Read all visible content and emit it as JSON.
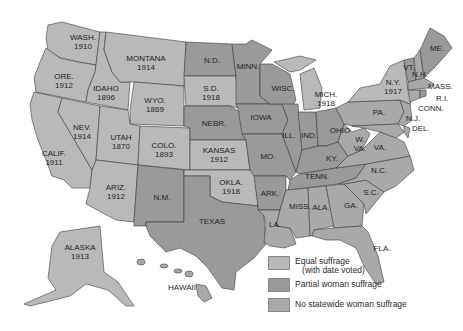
{
  "map": {
    "title": "Woman suffrage before the 19th Amendment",
    "states": [
      {
        "id": "wa",
        "label": "WASH.",
        "year": "1910",
        "category": "equal"
      },
      {
        "id": "or",
        "label": "ORE.",
        "year": "1912",
        "category": "equal"
      },
      {
        "id": "ca",
        "label": "CALIF.",
        "year": "1911",
        "category": "equal"
      },
      {
        "id": "id",
        "label": "IDAHO",
        "year": "1896",
        "category": "equal"
      },
      {
        "id": "nv",
        "label": "NEV.",
        "year": "1914",
        "category": "equal"
      },
      {
        "id": "mt",
        "label": "MONTANA",
        "year": "1914",
        "category": "equal"
      },
      {
        "id": "wy",
        "label": "WYO.",
        "year": "1869",
        "category": "equal"
      },
      {
        "id": "ut",
        "label": "UTAH",
        "year": "1870",
        "category": "equal"
      },
      {
        "id": "az",
        "label": "ARIZ.",
        "year": "1912",
        "category": "equal"
      },
      {
        "id": "co",
        "label": "COLO.",
        "year": "1893",
        "category": "equal"
      },
      {
        "id": "nm",
        "label": "N.M.",
        "year": "",
        "category": "partial"
      },
      {
        "id": "nd",
        "label": "N.D.",
        "year": "",
        "category": "partial"
      },
      {
        "id": "sd",
        "label": "S.D.",
        "year": "1918",
        "category": "equal"
      },
      {
        "id": "ne",
        "label": "NEBR.",
        "year": "",
        "category": "partial"
      },
      {
        "id": "ks",
        "label": "KANSAS",
        "year": "1912",
        "category": "equal"
      },
      {
        "id": "ok",
        "label": "OKLA.",
        "year": "1918",
        "category": "equal"
      },
      {
        "id": "tx",
        "label": "TEXAS",
        "year": "",
        "category": "partial"
      },
      {
        "id": "mn",
        "label": "MINN.",
        "year": "",
        "category": "partial"
      },
      {
        "id": "ia",
        "label": "IOWA",
        "year": "",
        "category": "partial"
      },
      {
        "id": "mo",
        "label": "MO.",
        "year": "",
        "category": "partial"
      },
      {
        "id": "ar",
        "label": "ARK.",
        "year": "",
        "category": "partial"
      },
      {
        "id": "la",
        "label": "LA.",
        "year": "",
        "category": "none"
      },
      {
        "id": "wi",
        "label": "WISC.",
        "year": "",
        "category": "partial"
      },
      {
        "id": "il",
        "label": "ILL.",
        "year": "",
        "category": "partial"
      },
      {
        "id": "mi",
        "label": "MICH.",
        "year": "1918",
        "category": "equal"
      },
      {
        "id": "in",
        "label": "IND.",
        "year": "",
        "category": "partial"
      },
      {
        "id": "oh",
        "label": "OHIO",
        "year": "",
        "category": "partial"
      },
      {
        "id": "ky",
        "label": "KY.",
        "year": "",
        "category": "partial"
      },
      {
        "id": "tn",
        "label": "TENN.",
        "year": "",
        "category": "partial"
      },
      {
        "id": "ms",
        "label": "MISS.",
        "year": "",
        "category": "none"
      },
      {
        "id": "al",
        "label": "ALA.",
        "year": "",
        "category": "none"
      },
      {
        "id": "ga",
        "label": "GA.",
        "year": "",
        "category": "none"
      },
      {
        "id": "fl",
        "label": "FLA.",
        "year": "",
        "category": "none"
      },
      {
        "id": "sc",
        "label": "S.C.",
        "year": "",
        "category": "none"
      },
      {
        "id": "nc",
        "label": "N.C.",
        "year": "",
        "category": "none"
      },
      {
        "id": "va",
        "label": "VA.",
        "year": "",
        "category": "none"
      },
      {
        "id": "wv",
        "label": "W.\nVA.",
        "year": "",
        "category": "none"
      },
      {
        "id": "pa",
        "label": "PA.",
        "year": "",
        "category": "none"
      },
      {
        "id": "ny",
        "label": "N.Y.",
        "year": "1917",
        "category": "equal"
      },
      {
        "id": "vt",
        "label": "VT.",
        "year": "",
        "category": "partial"
      },
      {
        "id": "nh",
        "label": "N.H.",
        "year": "",
        "category": "none"
      },
      {
        "id": "me",
        "label": "ME.",
        "year": "",
        "category": "partial"
      },
      {
        "id": "ma",
        "label": "MASS.",
        "year": "",
        "category": "none"
      },
      {
        "id": "ri",
        "label": "R.I.",
        "year": "",
        "category": "partial"
      },
      {
        "id": "ct",
        "label": "CONN.",
        "year": "",
        "category": "none"
      },
      {
        "id": "nj",
        "label": "N.J.",
        "year": "",
        "category": "none"
      },
      {
        "id": "de",
        "label": "DEL.",
        "year": "",
        "category": "none"
      },
      {
        "id": "md",
        "label": "MD.",
        "year": "",
        "category": "none"
      },
      {
        "id": "ak",
        "label": "ALASKA",
        "year": "1913",
        "category": "equal"
      },
      {
        "id": "hi",
        "label": "HAWAII",
        "year": "",
        "category": "none"
      }
    ],
    "labels": {
      "wa": "WASH.\n1910",
      "or": "ORE.\n1912",
      "ca": "CALIF.\n1911",
      "id": "IDAHO\n1896",
      "nv": "NEV.\n1914",
      "mt": "MONTANA\n1914",
      "wy": "WYO.\n1869",
      "ut": "UTAH\n1870",
      "az": "ARIZ.\n1912",
      "co": "COLO.\n1893",
      "nm": "N.M.",
      "nd": "N.D.",
      "sd": "S.D.\n1918",
      "ne": "NEBR.",
      "ks": "KANSAS\n1912",
      "ok": "OKLA.\n1918",
      "tx": "TEXAS",
      "mn": "MINN.",
      "ia": "IOWA",
      "mo": "MO.",
      "ar": "ARK.",
      "la": "LA.",
      "wi": "WISC.",
      "il": "ILL.",
      "mi": "MICH.\n1918",
      "in": "IND.",
      "oh": "OHIO",
      "ky": "KY.",
      "tn": "TENN.",
      "ms": "MISS.",
      "al": "ALA.",
      "ga": "GA.",
      "fl": "FLA.",
      "sc": "S.C.",
      "nc": "N.C.",
      "va": "VA.",
      "wv": "W.\nVA.",
      "pa": "PA.",
      "ny": "N.Y.\n1917",
      "vt": "VT.",
      "nh": "N.H.",
      "me": "ME.",
      "ma": "MASS.",
      "ri": "R.I.",
      "ct": "CONN.",
      "nj": "N.J.",
      "de": "DEL.",
      "md": "MD.",
      "ak": "ALASKA\n1913",
      "hi": "HAWAII"
    }
  },
  "legend": {
    "items": [
      {
        "category": "equal",
        "label": "Equal suffrage\n   (with date voted)",
        "color": "#b9b9b9"
      },
      {
        "category": "partial",
        "label": "Partial woman suffrage",
        "color": "#9a9a9a"
      },
      {
        "category": "none",
        "label": "No statewide woman suffrage",
        "color": "#a9a9a9"
      }
    ]
  },
  "colors": {
    "equal": "#b9b9b9",
    "partial": "#9a9a9a",
    "none": "#a9a9a9",
    "border": "#3a3a3a",
    "background": "#ffffff"
  }
}
